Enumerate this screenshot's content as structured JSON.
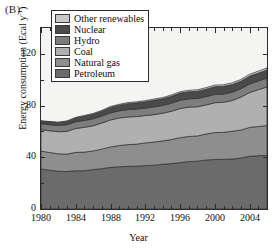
{
  "panel": {
    "label": "(B)"
  },
  "axes": {
    "ylabel_text": "Energy consumption (Ecal y",
    "ylabel_sup": "-1",
    "ylabel_close": ")",
    "xlabel": "Year",
    "yticks": [
      0,
      40,
      80,
      120
    ],
    "xticks": [
      1980,
      1984,
      1988,
      1992,
      1996,
      2000,
      2004
    ]
  },
  "legend": {
    "items": [
      {
        "label": "Other renewables",
        "color": "#c9c9c9"
      },
      {
        "label": "Nuclear",
        "color": "#4a4a4a"
      },
      {
        "label": "Hydro",
        "color": "#7d7d7d"
      },
      {
        "label": "Coal",
        "color": "#b0b0b0"
      },
      {
        "label": "Natural gas",
        "color": "#8e8e8e"
      },
      {
        "label": "Petroleum",
        "color": "#6b6b6b"
      }
    ]
  },
  "chart_data": {
    "type": "area",
    "stacked": true,
    "title": "",
    "xlabel": "Year",
    "ylabel": "Energy consumption (Ecal y-1)",
    "xlim": [
      1980,
      2006
    ],
    "ylim": [
      0,
      140
    ],
    "yticks": [
      0,
      40,
      80,
      120
    ],
    "xticks": [
      1980,
      1984,
      1988,
      1992,
      1996,
      2000,
      2004
    ],
    "grid": false,
    "legend_position": "top-left",
    "x": [
      1980,
      1981,
      1982,
      1983,
      1984,
      1985,
      1986,
      1987,
      1988,
      1989,
      1990,
      1991,
      1992,
      1993,
      1994,
      1995,
      1996,
      1997,
      1998,
      1999,
      2000,
      2001,
      2002,
      2003,
      2004,
      2005,
      2006
    ],
    "series": [
      {
        "name": "Petroleum",
        "color": "#6b6b6b",
        "values": [
          31.0,
          30.0,
          29.2,
          29.0,
          29.6,
          29.6,
          30.5,
          31.2,
          32.2,
          32.7,
          33.0,
          33.1,
          33.6,
          33.9,
          34.6,
          35.1,
          35.9,
          36.7,
          37.0,
          37.9,
          38.3,
          38.4,
          38.6,
          39.4,
          40.8,
          41.2,
          41.5
        ]
      },
      {
        "name": "Natural gas",
        "color": "#8e8e8e",
        "values": [
          13.8,
          13.7,
          13.5,
          13.5,
          14.2,
          14.4,
          14.4,
          15.1,
          15.8,
          16.4,
          16.8,
          17.1,
          17.5,
          17.9,
          18.1,
          18.6,
          19.3,
          19.4,
          19.5,
          20.1,
          20.8,
          20.9,
          21.5,
          21.7,
          22.3,
          22.6,
          23.1
        ]
      },
      {
        "name": "Coal",
        "color": "#b0b0b0",
        "values": [
          16.6,
          16.8,
          17.1,
          17.6,
          18.5,
          19.2,
          19.5,
          20.2,
          20.9,
          21.3,
          21.4,
          21.3,
          21.2,
          21.2,
          21.4,
          21.9,
          22.5,
          22.7,
          22.6,
          22.5,
          23.1,
          23.3,
          23.8,
          25.5,
          27.0,
          28.5,
          29.8
        ]
      },
      {
        "name": "Hydro",
        "color": "#7d7d7d",
        "values": [
          4.6,
          4.7,
          4.8,
          5.1,
          5.2,
          5.3,
          5.4,
          5.4,
          5.5,
          5.5,
          5.7,
          5.8,
          5.8,
          6.0,
          6.0,
          6.2,
          6.4,
          6.4,
          6.4,
          6.4,
          6.5,
          6.3,
          6.4,
          6.4,
          6.6,
          6.7,
          6.9
        ]
      },
      {
        "name": "Nuclear",
        "color": "#4a4a4a",
        "values": [
          1.9,
          2.1,
          2.2,
          2.5,
          2.9,
          3.3,
          3.5,
          3.8,
          4.2,
          4.4,
          4.6,
          4.8,
          4.9,
          5.1,
          5.2,
          5.4,
          5.6,
          5.5,
          5.6,
          5.8,
          5.9,
          6.0,
          6.0,
          5.9,
          6.1,
          6.1,
          6.2
        ]
      },
      {
        "name": "Other renewables",
        "color": "#c9c9c9",
        "values": [
          0.4,
          0.4,
          0.4,
          0.5,
          0.5,
          0.6,
          0.6,
          0.6,
          0.7,
          0.7,
          0.8,
          0.8,
          0.8,
          0.9,
          0.9,
          1.0,
          1.0,
          1.1,
          1.1,
          1.2,
          1.2,
          1.2,
          1.3,
          1.3,
          1.4,
          1.5,
          1.6
        ]
      }
    ],
    "totals": [
      68.3,
      67.7,
      67.2,
      68.2,
      70.9,
      72.4,
      73.9,
      76.3,
      79.3,
      81.0,
      82.3,
      82.9,
      83.8,
      85.0,
      86.2,
      88.2,
      90.7,
      91.8,
      92.2,
      93.9,
      95.8,
      96.1,
      97.6,
      100.2,
      104.2,
      106.6,
      109.1
    ]
  }
}
